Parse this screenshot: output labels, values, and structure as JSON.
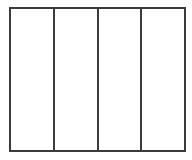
{
  "diagram": {
    "type": "panel-grid",
    "background_color": "#ffffff",
    "line_color": "#3b3b3b",
    "frame": {
      "border_width_px": 2,
      "x": 9,
      "y": 7,
      "width": 177,
      "height": 145
    },
    "dividers": {
      "count": 3,
      "orientation": "vertical",
      "width_px": 2,
      "x_positions": [
        53,
        98,
        143
      ]
    },
    "panels": [
      {
        "index": "1",
        "label": ""
      },
      {
        "index": "2",
        "label": ""
      },
      {
        "index": "3",
        "label": ""
      },
      {
        "index": "4",
        "label": ""
      }
    ]
  }
}
